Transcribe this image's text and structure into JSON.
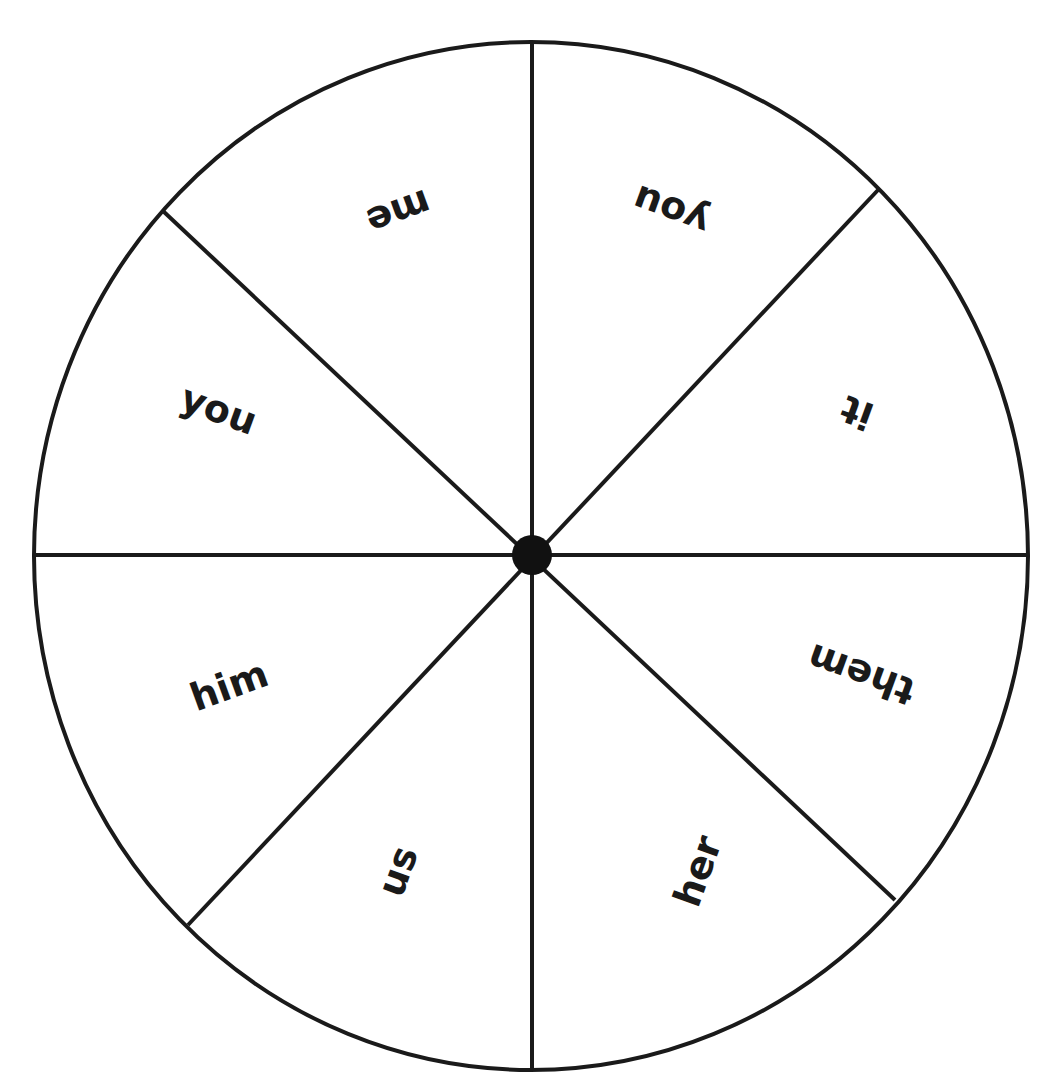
{
  "diagram": {
    "type": "spinner-wheel",
    "segments": 8,
    "colors": {
      "stroke": "#1a1a1a",
      "fill": "#ffffff",
      "hub": "#111111",
      "text": "#1a1a1a"
    },
    "labels": [
      {
        "id": "me",
        "text": "me",
        "x": 398,
        "y": 210,
        "rotate": 160
      },
      {
        "id": "you-top",
        "text": "you",
        "x": 672,
        "y": 208,
        "rotate": 200
      },
      {
        "id": "it",
        "text": "it",
        "x": 858,
        "y": 410,
        "rotate": 200
      },
      {
        "id": "them",
        "text": "them",
        "x": 862,
        "y": 672,
        "rotate": 200
      },
      {
        "id": "her",
        "text": "her",
        "x": 700,
        "y": 872,
        "rotate": 290
      },
      {
        "id": "us",
        "text": "us",
        "x": 400,
        "y": 872,
        "rotate": 290
      },
      {
        "id": "him",
        "text": "him",
        "x": 230,
        "y": 688,
        "rotate": -20
      },
      {
        "id": "you-left",
        "text": "you",
        "x": 218,
        "y": 412,
        "rotate": 20
      }
    ]
  }
}
